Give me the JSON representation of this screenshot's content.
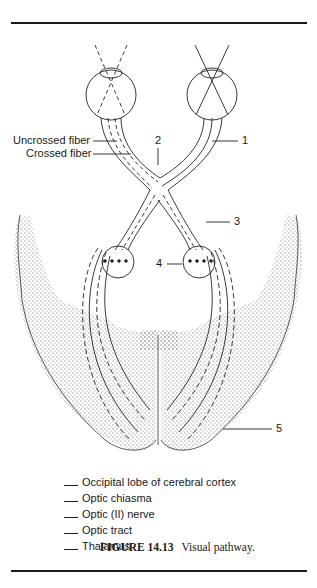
{
  "figure": {
    "number": "FIGURE 14.13",
    "title": "Visual pathway."
  },
  "callouts": {
    "uncrossed_fiber": "Uncrossed fiber",
    "crossed_fiber": "Crossed fiber",
    "n1": "1",
    "n2": "2",
    "n3": "3",
    "n4": "4",
    "n5": "5"
  },
  "key": {
    "items": [
      {
        "label": "Occipital lobe of cerebral cortex"
      },
      {
        "label": "Optic chiasma"
      },
      {
        "label": "Optic (II) nerve"
      },
      {
        "label": "Optic tract"
      },
      {
        "label": "Thalamus"
      }
    ]
  }
}
